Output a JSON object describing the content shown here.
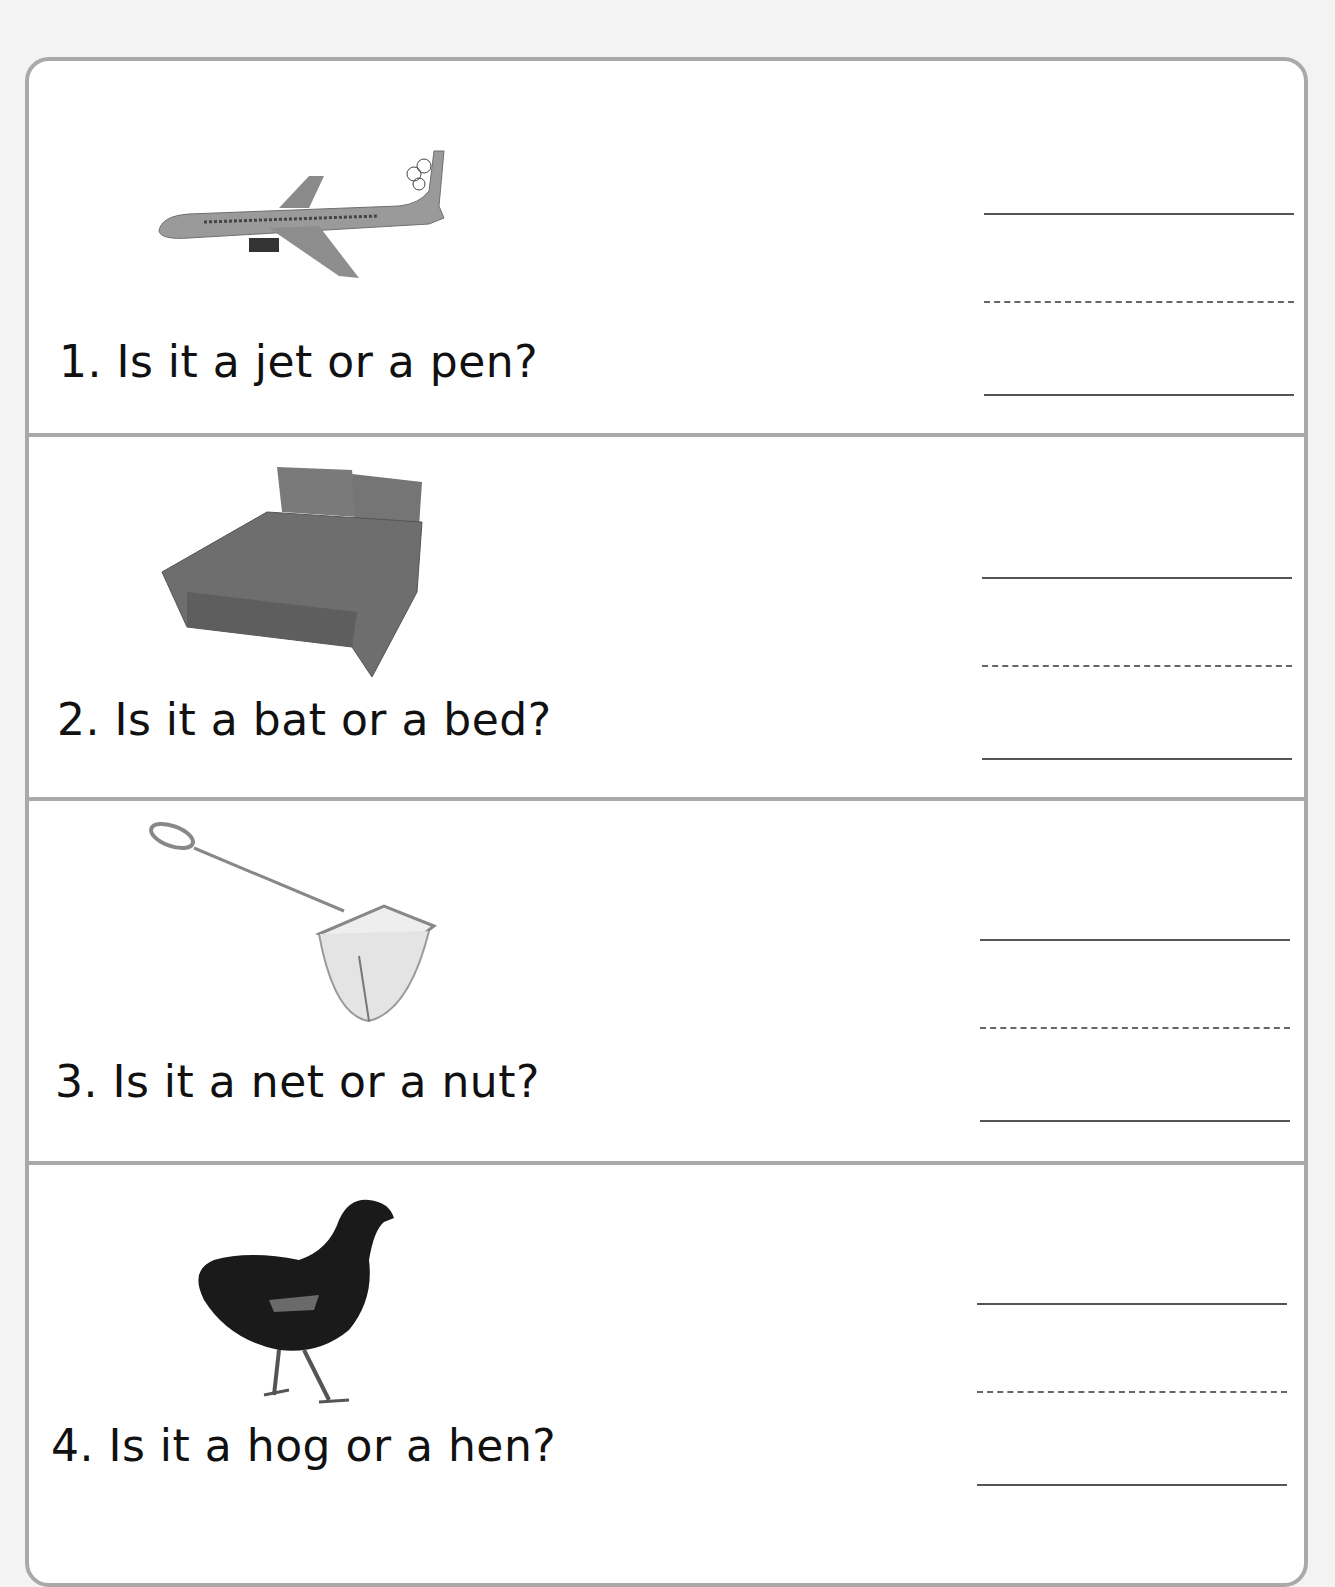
{
  "header": {
    "title_fragment": ""
  },
  "worksheet": {
    "items": [
      {
        "number": "1.",
        "question": "1. Is it a jet or a pen?",
        "picture": "airplane-jet",
        "choices": [
          "jet",
          "pen"
        ]
      },
      {
        "number": "2.",
        "question": "2. Is it a bat or a bed?",
        "picture": "bed",
        "choices": [
          "bat",
          "bed"
        ]
      },
      {
        "number": "3.",
        "question": "3. Is it a net or a nut?",
        "picture": "fishing-net",
        "choices": [
          "net",
          "nut"
        ]
      },
      {
        "number": "4.",
        "question": "4. Is it a hog or a hen?",
        "picture": "hen",
        "choices": [
          "hog",
          "hen"
        ]
      }
    ],
    "answer_lines": [
      "",
      "",
      "",
      ""
    ]
  },
  "colors": {
    "border": "#a9a9a9",
    "text": "#111111",
    "background": "#f3f3f3",
    "panel": "#ffffff"
  }
}
